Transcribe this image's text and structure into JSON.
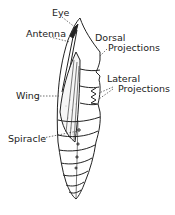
{
  "figure": {
    "labels": {
      "eye": "Eye",
      "antenna": "Antenna",
      "dorsal": [
        "Dorsal",
        "Projections"
      ],
      "lateral": [
        "Lateral",
        "Projections"
      ],
      "wing": "Wing",
      "spiracle": "Spiracle"
    },
    "colors": {
      "ink": "#222222",
      "background": "#ffffff"
    }
  }
}
